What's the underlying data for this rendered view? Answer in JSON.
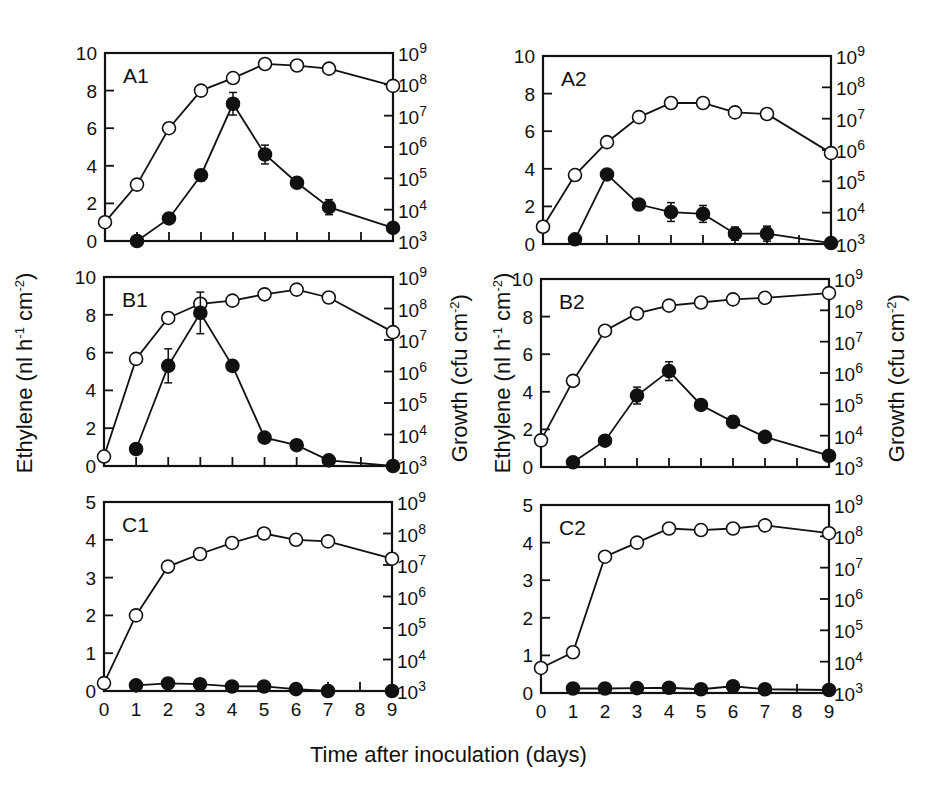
{
  "figure": {
    "xlabel": "Time after inoculation (days)",
    "ylabel_left": "Ethylene (nl h-1 cm-2)",
    "ylabel_right": "Growth (cfu cm-2)"
  },
  "chart_data": [
    {
      "type": "line",
      "panel": "A1",
      "title": "A1",
      "xlabel": "Time after inoculation (days)",
      "ylabel": "Ethylene (nl h-1 cm-2)",
      "ylabel_right": "Growth (cfu cm-2)",
      "x_ticks": [
        0,
        1,
        2,
        3,
        4,
        5,
        6,
        7,
        8,
        9
      ],
      "xlim": [
        0,
        9
      ],
      "ylim": [
        0,
        10
      ],
      "y_ticks": [
        0,
        2,
        4,
        6,
        8,
        10
      ],
      "y2_ticks": [
        "10^3",
        "10^4",
        "10^5",
        "10^6",
        "10^7",
        "10^8",
        "10^9"
      ],
      "y2lim_log10": [
        3,
        9
      ],
      "grid": false,
      "series": [
        {
          "name": "Growth (open circles)",
          "marker": "open",
          "axis": "right_log10",
          "x": [
            0,
            1,
            2,
            3,
            4,
            5,
            6,
            7,
            9
          ],
          "values_log10": [
            3.6,
            4.8,
            6.6,
            7.8,
            8.2,
            8.65,
            8.6,
            8.5,
            7.95
          ]
        },
        {
          "name": "Ethylene (filled circles)",
          "marker": "filled",
          "axis": "left",
          "x": [
            1,
            2,
            3,
            4,
            5,
            6,
            7,
            9
          ],
          "values": [
            0.0,
            1.2,
            3.5,
            7.3,
            4.6,
            3.1,
            1.8,
            0.7
          ],
          "errors": [
            0,
            0.1,
            0.3,
            0.6,
            0.5,
            0.2,
            0.4,
            0.1
          ]
        }
      ]
    },
    {
      "type": "line",
      "panel": "A2",
      "title": "A2",
      "x_ticks": [
        0,
        1,
        2,
        3,
        4,
        5,
        6,
        7,
        8,
        9
      ],
      "xlim": [
        0,
        9
      ],
      "ylim": [
        0,
        10
      ],
      "y_ticks": [
        0,
        2,
        4,
        6,
        8,
        10
      ],
      "y2_ticks": [
        "10^3",
        "10^4",
        "10^5",
        "10^6",
        "10^7",
        "10^8",
        "10^9"
      ],
      "y2lim_log10": [
        3,
        9
      ],
      "series": [
        {
          "name": "Growth (open circles)",
          "marker": "open",
          "axis": "right_log10",
          "x": [
            0,
            1,
            2,
            3,
            4,
            5,
            6,
            7,
            9
          ],
          "values_log10": [
            3.55,
            5.2,
            6.25,
            7.05,
            7.5,
            7.5,
            7.2,
            7.15,
            5.9
          ]
        },
        {
          "name": "Ethylene (filled circles)",
          "marker": "filled",
          "axis": "left",
          "x": [
            1,
            2,
            3,
            4,
            5,
            6,
            7,
            9
          ],
          "values": [
            0.25,
            3.7,
            2.1,
            1.7,
            1.6,
            0.55,
            0.55,
            0.05
          ],
          "errors": [
            0,
            0.2,
            0.1,
            0.5,
            0.45,
            0.35,
            0.4,
            0
          ]
        }
      ]
    },
    {
      "type": "line",
      "panel": "B1",
      "title": "B1",
      "x_ticks": [
        0,
        1,
        2,
        3,
        4,
        5,
        6,
        7,
        8,
        9
      ],
      "xlim": [
        0,
        9
      ],
      "ylim": [
        0,
        10
      ],
      "y_ticks": [
        0,
        2,
        4,
        6,
        8,
        10
      ],
      "y2_ticks": [
        "10^3",
        "10^4",
        "10^5",
        "10^6",
        "10^7",
        "10^8",
        "10^9"
      ],
      "y2lim_log10": [
        3,
        9
      ],
      "series": [
        {
          "name": "Growth (open circles)",
          "marker": "open",
          "axis": "right_log10",
          "x": [
            0,
            1,
            2,
            3,
            4,
            5,
            6,
            7,
            9
          ],
          "values_log10": [
            3.3,
            6.4,
            7.7,
            8.15,
            8.25,
            8.45,
            8.6,
            8.35,
            7.25
          ]
        },
        {
          "name": "Ethylene (filled circles)",
          "marker": "filled",
          "axis": "left",
          "x": [
            1,
            2,
            3,
            4,
            5,
            6,
            7,
            9
          ],
          "values": [
            0.9,
            5.3,
            8.1,
            5.3,
            1.5,
            1.1,
            0.3,
            0.0
          ],
          "errors": [
            0,
            0.9,
            1.1,
            0,
            0,
            0,
            0,
            0
          ]
        }
      ]
    },
    {
      "type": "line",
      "panel": "B2",
      "title": "B2",
      "x_ticks": [
        0,
        1,
        2,
        3,
        4,
        5,
        6,
        7,
        8,
        9
      ],
      "xlim": [
        0,
        9
      ],
      "ylim": [
        0,
        10
      ],
      "y_ticks": [
        0,
        2,
        4,
        6,
        8,
        10
      ],
      "y2_ticks": [
        "10^3",
        "10^4",
        "10^5",
        "10^6",
        "10^7",
        "10^8",
        "10^9"
      ],
      "y2lim_log10": [
        3,
        9
      ],
      "series": [
        {
          "name": "Growth (open circles)",
          "marker": "open",
          "axis": "right_log10",
          "x": [
            0,
            1,
            2,
            3,
            4,
            5,
            6,
            7,
            9
          ],
          "values_log10": [
            3.85,
            5.75,
            7.35,
            7.9,
            8.15,
            8.25,
            8.35,
            8.4,
            8.55
          ]
        },
        {
          "name": "Ethylene (filled circles)",
          "marker": "filled",
          "axis": "left",
          "x": [
            1,
            2,
            3,
            4,
            5,
            6,
            7,
            9
          ],
          "values": [
            0.25,
            1.4,
            3.8,
            5.1,
            3.3,
            2.4,
            1.6,
            0.6
          ],
          "errors": [
            0,
            0,
            0.45,
            0.5,
            0,
            0.3,
            0,
            0
          ]
        }
      ]
    },
    {
      "type": "line",
      "panel": "C1",
      "title": "C1",
      "x_ticks": [
        0,
        1,
        2,
        3,
        4,
        5,
        6,
        7,
        8,
        9
      ],
      "xlim": [
        0,
        9
      ],
      "ylim": [
        0,
        5
      ],
      "y_ticks": [
        0,
        1,
        2,
        3,
        4,
        5
      ],
      "y2_ticks": [
        "10^3",
        "10^4",
        "10^5",
        "10^6",
        "10^7",
        "10^8",
        "10^9"
      ],
      "y2lim_log10": [
        3,
        9
      ],
      "series": [
        {
          "name": "Growth (open circles)",
          "marker": "open",
          "axis": "right_log10",
          "x": [
            0,
            1,
            2,
            3,
            4,
            5,
            6,
            7,
            9
          ],
          "values_log10": [
            3.25,
            5.4,
            6.95,
            7.35,
            7.7,
            8.0,
            7.8,
            7.75,
            7.2
          ]
        },
        {
          "name": "Ethylene (filled circles)",
          "marker": "filled",
          "axis": "left",
          "x": [
            1,
            2,
            3,
            4,
            5,
            6,
            7,
            9
          ],
          "values": [
            0.15,
            0.2,
            0.18,
            0.12,
            0.12,
            0.05,
            0.0,
            0.0
          ],
          "errors": [
            0,
            0,
            0,
            0,
            0,
            0,
            0,
            0
          ]
        }
      ]
    },
    {
      "type": "line",
      "panel": "C2",
      "title": "C2",
      "x_ticks": [
        0,
        1,
        2,
        3,
        4,
        5,
        6,
        7,
        8,
        9
      ],
      "xlim": [
        0,
        9
      ],
      "ylim": [
        0,
        5
      ],
      "y_ticks": [
        0,
        1,
        2,
        3,
        4,
        5
      ],
      "y2_ticks": [
        "10^3",
        "10^4",
        "10^5",
        "10^6",
        "10^7",
        "10^8",
        "10^9"
      ],
      "y2lim_log10": [
        3,
        9
      ],
      "series": [
        {
          "name": "Growth (open circles)",
          "marker": "open",
          "axis": "right_log10",
          "x": [
            0,
            1,
            2,
            3,
            4,
            5,
            6,
            7,
            9
          ],
          "values_log10": [
            3.8,
            4.3,
            7.35,
            7.8,
            8.25,
            8.2,
            8.25,
            8.35,
            8.1
          ]
        },
        {
          "name": "Ethylene (filled circles)",
          "marker": "filled",
          "axis": "left",
          "x": [
            1,
            2,
            3,
            4,
            5,
            6,
            7,
            9
          ],
          "values": [
            0.12,
            0.12,
            0.13,
            0.14,
            0.1,
            0.18,
            0.1,
            0.08
          ],
          "errors": [
            0,
            0,
            0,
            0,
            0,
            0,
            0,
            0
          ]
        }
      ]
    }
  ],
  "layout": {
    "panels": [
      {
        "id": "A1",
        "left": 105,
        "top": 53,
        "width": 288,
        "height": 188,
        "show_x_tick_labels": false
      },
      {
        "id": "A2",
        "left": 543,
        "top": 56,
        "width": 288,
        "height": 188,
        "show_x_tick_labels": false
      },
      {
        "id": "B1",
        "left": 104,
        "top": 277,
        "width": 289,
        "height": 189,
        "show_x_tick_labels": false
      },
      {
        "id": "B2",
        "left": 541,
        "top": 279,
        "width": 288,
        "height": 188,
        "show_x_tick_labels": false
      },
      {
        "id": "C1",
        "left": 104,
        "top": 502,
        "width": 288,
        "height": 189,
        "show_x_tick_labels": true
      },
      {
        "id": "C2",
        "left": 541,
        "top": 505,
        "width": 288,
        "height": 188,
        "show_x_tick_labels": true
      }
    ]
  }
}
